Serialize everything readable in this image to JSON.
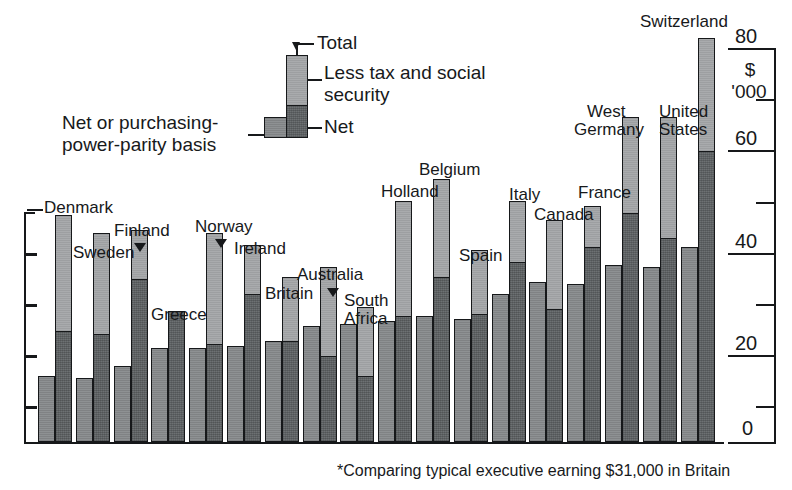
{
  "chart_data": {
    "type": "bar",
    "title": "",
    "subtitle": "",
    "xlabel": "",
    "ylabel": "",
    "unit_label_line1": "$",
    "unit_label_line2": "'000",
    "ylim": [
      0,
      85
    ],
    "yticks": [
      0,
      20,
      40,
      60,
      80
    ],
    "ytick_labels": [
      "0",
      "20",
      "40",
      "60",
      "80"
    ],
    "minor_yticks": [
      10,
      30,
      50,
      70
    ],
    "grid": false,
    "legend_position": "top-center",
    "footnote": "*Comparing typical executive earning $31,000 in Britain",
    "series": [
      {
        "name": "Net or purchasing-power-parity basis",
        "key": "ppp"
      },
      {
        "name": "Total",
        "key": "total"
      },
      {
        "name": "Net",
        "key": "net"
      }
    ],
    "categories": [
      "Denmark",
      "Sweden",
      "Finland",
      "Greece",
      "Norway",
      "Ireland",
      "Britain",
      "Australia",
      "South Africa",
      "Holland",
      "Belgium",
      "Spain",
      "Italy",
      "Canada",
      "France",
      "West Germany",
      "United States",
      "Switzerland"
    ],
    "ppp": [
      13.5,
      13.0,
      15.5,
      19.0,
      19.0,
      19.5,
      20.5,
      23.5,
      24.0,
      24.5,
      25.5,
      25.0,
      30.0,
      32.5,
      32.0,
      36.0,
      35.5,
      39.5
    ],
    "net": [
      22.5,
      22.0,
      33.0,
      26.5,
      20.0,
      30.0,
      20.5,
      17.5,
      13.5,
      25.5,
      33.5,
      26.0,
      36.5,
      27.0,
      39.5,
      46.5,
      41.5,
      59.0
    ],
    "total": [
      46.0,
      42.5,
      43.0,
      25.5,
      42.5,
      40.0,
      33.5,
      35.5,
      27.5,
      49.0,
      53.5,
      39.0,
      49.0,
      45.0,
      48.0,
      66.0,
      66.0,
      82.0
    ]
  },
  "legend": {
    "total_label": "Total",
    "tax_label_line1": "Less tax and social",
    "tax_label_line2": "security",
    "net_label": "Net",
    "ppp_label_line1": "Net or purchasing-",
    "ppp_label_line2": "power-parity basis"
  },
  "axis": {
    "unit_dollar": "$",
    "unit_thousands": "'000",
    "t80": "80",
    "t60": "60",
    "t40": "40",
    "t20": "20",
    "t0": "0"
  },
  "labels": {
    "denmark": "Denmark",
    "sweden": "Sweden",
    "finland": "Finland",
    "greece": "Greece",
    "norway": "Norway",
    "ireland": "Ireland",
    "britain": "Britain",
    "australia": "Australia",
    "southafrica1": "South",
    "southafrica2": "Africa",
    "holland": "Holland",
    "belgium": "Belgium",
    "spain": "Spain",
    "italy": "Italy",
    "canada": "Canada",
    "france": "France",
    "westgermany1": "West",
    "westgermany2": "Germany",
    "unitedstates1": "United",
    "unitedstates2": "States",
    "switzerland": "Switzerland"
  },
  "footnote": {
    "text": "*Comparing typical executive earning $31,000 in Britain"
  }
}
